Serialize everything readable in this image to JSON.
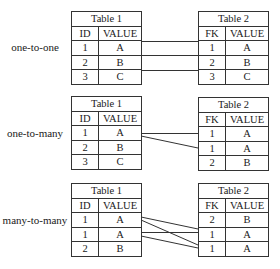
{
  "sections": [
    {
      "label": "one-to-one",
      "left": {
        "title": "Table 1",
        "headers": [
          "ID",
          "VALUE"
        ],
        "rows": [
          [
            "1",
            "A"
          ],
          [
            "2",
            "B"
          ],
          [
            "3",
            "C"
          ]
        ]
      },
      "right": {
        "title": "Table 2",
        "headers": [
          "FK",
          "VALUE"
        ],
        "rows": [
          [
            "1",
            "A"
          ],
          [
            "2",
            "B"
          ],
          [
            "3",
            "C"
          ]
        ]
      }
    },
    {
      "label": "one-to-many",
      "left": {
        "title": "Table 1",
        "headers": [
          "ID",
          "VALUE"
        ],
        "rows": [
          [
            "1",
            "A"
          ],
          [
            "2",
            "B"
          ],
          [
            "3",
            "C"
          ]
        ]
      },
      "right": {
        "title": "Table 2",
        "headers": [
          "FK",
          "VALUE"
        ],
        "rows": [
          [
            "1",
            "A"
          ],
          [
            "1",
            "A"
          ],
          [
            "2",
            "B"
          ]
        ]
      }
    },
    {
      "label": "many-to-many",
      "left": {
        "title": "Table 1",
        "headers": [
          "ID",
          "VALUE"
        ],
        "rows": [
          [
            "1",
            "A"
          ],
          [
            "1",
            "A"
          ],
          [
            "2",
            "B"
          ]
        ]
      },
      "right": {
        "title": "Table 2",
        "headers": [
          "FK",
          "VALUE"
        ],
        "rows": [
          [
            "2",
            "B"
          ],
          [
            "1",
            "A"
          ],
          [
            "1",
            "A"
          ]
        ]
      }
    }
  ]
}
